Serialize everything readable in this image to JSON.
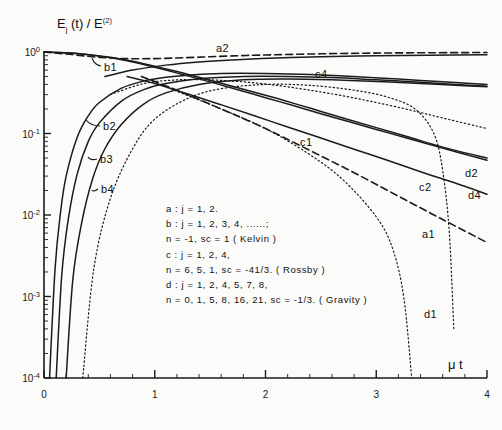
{
  "figure": {
    "ylabel_main": "E",
    "ylabel_sub": "j",
    "ylabel_rest": " (t) / E",
    "ylabel_sup": "(2)",
    "xlabel": "μ t"
  },
  "axes": {
    "y_ticks": [
      "10",
      "10",
      "10",
      "10",
      "10"
    ],
    "y_tick_exponents": [
      "0",
      "-1",
      "-2",
      "-3",
      "-4"
    ],
    "x_ticks": [
      "0",
      "1",
      "2",
      "3",
      "4"
    ]
  },
  "curve_labels": {
    "a2": "a2",
    "a1": "a1",
    "b1": "b1",
    "b2": "b2",
    "b3": "b3",
    "b4": "b4",
    "c1": "c1",
    "c2": "c2",
    "c4": "c4",
    "d1": "d1",
    "d2": "d2",
    "d4": "d4"
  },
  "legend": {
    "lines": [
      "a :  j = 1, 2.",
      "b :  j = 1, 2, 3, 4, ......;",
      "       n = -1,  sc = 1   ( Kelvin )",
      "c :  j = 1, 2, 4,",
      "       n = 6, 5, 1,  sc = -41/3. ( Rossby )",
      "d :  j = 1, 2, 4, 5, 7, 8,",
      "       n = 0, 1, 5, 8, 16, 21,  sc = -1/3. ( Gravity )"
    ]
  },
  "chart_data": {
    "type": "line",
    "xlabel": "μ t",
    "ylabel": "Ej(t)/E(2)",
    "xlim": [
      0,
      4
    ],
    "ylim_log": [
      0.0001,
      1
    ],
    "yscale": "log",
    "xscale": "linear",
    "grid": false,
    "legend_position": "inside-center",
    "series": [
      {
        "name": "a2",
        "label": "a2",
        "style": "dashed",
        "points": [
          [
            0,
            1.0
          ],
          [
            0.25,
            0.93
          ],
          [
            0.5,
            0.86
          ],
          [
            0.75,
            0.83
          ],
          [
            1.0,
            0.83
          ],
          [
            1.25,
            0.85
          ],
          [
            1.5,
            0.875
          ],
          [
            1.75,
            0.9
          ],
          [
            2.0,
            0.92
          ],
          [
            2.5,
            0.95
          ],
          [
            3.0,
            0.97
          ],
          [
            3.5,
            0.98
          ],
          [
            4.0,
            0.985
          ]
        ]
      },
      {
        "name": "a1",
        "label": "a1",
        "style": "dashed",
        "points": [
          [
            0.88,
            0.5
          ],
          [
            1.2,
            0.34
          ],
          [
            1.6,
            0.2
          ],
          [
            2.0,
            0.115
          ],
          [
            2.4,
            0.062
          ],
          [
            2.8,
            0.033
          ],
          [
            3.2,
            0.017
          ],
          [
            3.6,
            0.0088
          ],
          [
            4.0,
            0.0046
          ]
        ]
      },
      {
        "name": "b1",
        "label": "b1",
        "style": "solid",
        "points": [
          [
            0,
            1.0
          ],
          [
            0.25,
            0.97
          ],
          [
            0.5,
            0.89
          ],
          [
            0.75,
            0.78
          ],
          [
            1.0,
            0.65
          ],
          [
            1.25,
            0.53
          ],
          [
            1.5,
            0.43
          ],
          [
            1.75,
            0.345
          ],
          [
            2.0,
            0.275
          ],
          [
            2.25,
            0.22
          ],
          [
            2.5,
            0.175
          ],
          [
            2.75,
            0.14
          ],
          [
            3.0,
            0.112
          ],
          [
            3.25,
            0.09
          ],
          [
            3.5,
            0.072
          ],
          [
            3.75,
            0.058
          ],
          [
            4.0,
            0.047
          ]
        ]
      },
      {
        "name": "b2",
        "label": "b2",
        "style": "solid",
        "points": [
          [
            0.05,
            0.0001
          ],
          [
            0.1,
            0.0022
          ],
          [
            0.15,
            0.011
          ],
          [
            0.2,
            0.03
          ],
          [
            0.3,
            0.09
          ],
          [
            0.4,
            0.165
          ],
          [
            0.5,
            0.24
          ],
          [
            0.7,
            0.36
          ],
          [
            0.9,
            0.44
          ],
          [
            1.1,
            0.49
          ],
          [
            1.3,
            0.52
          ],
          [
            1.6,
            0.545
          ],
          [
            2.0,
            0.545
          ],
          [
            2.4,
            0.53
          ],
          [
            2.8,
            0.5
          ],
          [
            3.2,
            0.465
          ],
          [
            3.6,
            0.43
          ],
          [
            4.0,
            0.4
          ]
        ]
      },
      {
        "name": "b3",
        "label": "b3",
        "style": "solid",
        "points": [
          [
            0.11,
            0.0001
          ],
          [
            0.16,
            0.0018
          ],
          [
            0.22,
            0.009
          ],
          [
            0.3,
            0.032
          ],
          [
            0.4,
            0.08
          ],
          [
            0.5,
            0.135
          ],
          [
            0.7,
            0.25
          ],
          [
            0.9,
            0.345
          ],
          [
            1.1,
            0.41
          ],
          [
            1.4,
            0.47
          ],
          [
            1.8,
            0.5
          ],
          [
            2.2,
            0.5
          ],
          [
            2.6,
            0.485
          ],
          [
            3.0,
            0.455
          ],
          [
            3.4,
            0.425
          ],
          [
            3.8,
            0.395
          ],
          [
            4.0,
            0.38
          ]
        ]
      },
      {
        "name": "b4",
        "label": "b4",
        "style": "solid",
        "points": [
          [
            0.2,
            0.0001
          ],
          [
            0.26,
            0.0016
          ],
          [
            0.34,
            0.008
          ],
          [
            0.44,
            0.028
          ],
          [
            0.55,
            0.065
          ],
          [
            0.7,
            0.13
          ],
          [
            0.9,
            0.23
          ],
          [
            1.1,
            0.315
          ],
          [
            1.4,
            0.4
          ],
          [
            1.8,
            0.455
          ],
          [
            2.2,
            0.465
          ],
          [
            2.6,
            0.455
          ],
          [
            3.0,
            0.435
          ],
          [
            3.4,
            0.41
          ],
          [
            3.8,
            0.385
          ],
          [
            4.0,
            0.375
          ]
        ]
      },
      {
        "name": "c1",
        "label": "c1",
        "style": "solid",
        "points": [
          [
            0,
            1.0
          ],
          [
            0.3,
            0.96
          ],
          [
            0.6,
            0.86
          ],
          [
            0.9,
            0.72
          ],
          [
            1.2,
            0.575
          ],
          [
            1.5,
            0.45
          ],
          [
            1.8,
            0.35
          ],
          [
            2.1,
            0.27
          ],
          [
            2.4,
            0.205
          ],
          [
            2.7,
            0.155
          ],
          [
            3.0,
            0.118
          ],
          [
            3.3,
            0.09
          ],
          [
            3.6,
            0.068
          ],
          [
            4.0,
            0.05
          ]
        ]
      },
      {
        "name": "c2",
        "label": "c2",
        "style": "solid",
        "points": [
          [
            0.75,
            0.5
          ],
          [
            1.0,
            0.41
          ],
          [
            1.3,
            0.305
          ],
          [
            1.6,
            0.225
          ],
          [
            1.9,
            0.165
          ],
          [
            2.2,
            0.12
          ],
          [
            2.5,
            0.088
          ],
          [
            2.8,
            0.064
          ],
          [
            3.1,
            0.047
          ],
          [
            3.4,
            0.034
          ],
          [
            3.7,
            0.025
          ],
          [
            4.0,
            0.018
          ]
        ]
      },
      {
        "name": "c4",
        "label": "c4",
        "style": "solid",
        "points": [
          [
            0.55,
            0.5
          ],
          [
            0.8,
            0.6
          ],
          [
            1.1,
            0.69
          ],
          [
            1.4,
            0.755
          ],
          [
            1.7,
            0.8
          ],
          [
            2.1,
            0.845
          ],
          [
            2.5,
            0.875
          ],
          [
            3.0,
            0.9
          ],
          [
            3.5,
            0.915
          ],
          [
            4.0,
            0.925
          ]
        ]
      },
      {
        "name": "d1",
        "label": "d1",
        "style": "dotted",
        "points": [
          [
            0.88,
            0.5
          ],
          [
            1.2,
            0.33
          ],
          [
            1.6,
            0.2
          ],
          [
            2.0,
            0.115
          ],
          [
            2.4,
            0.055
          ],
          [
            2.7,
            0.027
          ],
          [
            3.0,
            0.0095
          ],
          [
            3.15,
            0.0038
          ],
          [
            3.25,
            0.00095
          ],
          [
            3.32,
            0.0001
          ]
        ]
      },
      {
        "name": "d2",
        "label": "d2",
        "style": "dotted",
        "points": [
          [
            0.6,
            0.3
          ],
          [
            0.9,
            0.41
          ],
          [
            1.2,
            0.455
          ],
          [
            1.5,
            0.455
          ],
          [
            1.8,
            0.43
          ],
          [
            2.1,
            0.39
          ],
          [
            2.4,
            0.34
          ],
          [
            2.7,
            0.29
          ],
          [
            3.0,
            0.24
          ],
          [
            3.3,
            0.195
          ],
          [
            3.6,
            0.155
          ],
          [
            4.0,
            0.115
          ]
        ]
      },
      {
        "name": "d4",
        "label": "d4",
        "style": "dotted",
        "points": [
          [
            0.35,
            0.0001
          ],
          [
            0.45,
            0.0022
          ],
          [
            0.6,
            0.016
          ],
          [
            0.8,
            0.065
          ],
          [
            1.0,
            0.15
          ],
          [
            1.3,
            0.27
          ],
          [
            1.6,
            0.355
          ],
          [
            2.0,
            0.4
          ],
          [
            2.4,
            0.39
          ],
          [
            2.8,
            0.34
          ],
          [
            3.1,
            0.28
          ],
          [
            3.35,
            0.2
          ],
          [
            3.52,
            0.1
          ],
          [
            3.6,
            0.035
          ],
          [
            3.66,
            0.006
          ],
          [
            3.7,
            0.0004
          ]
        ]
      }
    ]
  }
}
